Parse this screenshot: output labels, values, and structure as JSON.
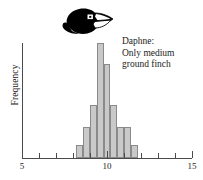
{
  "annotation": {
    "line1": "Daphne:",
    "line2": "Only medium",
    "line3": "ground finch"
  },
  "illustration": {
    "name": "medium-ground-finch-head",
    "color": "#000000",
    "eye_color": "#ffffff",
    "pupil_color": "#000000"
  },
  "chart_data": {
    "type": "bar",
    "title": "",
    "subtitle": "",
    "xlabel": "",
    "ylabel": "Frequency",
    "xlim": [
      5,
      15
    ],
    "ylim": [
      0,
      100
    ],
    "grid": false,
    "legend": null,
    "bar_fill": "#c9c9c9",
    "bar_stroke": "#8a8a8a",
    "axis_color": "#4a4a4a",
    "x_tick_labels": [
      "5",
      "10",
      "15"
    ],
    "x_tick_label_values": [
      5,
      10,
      15
    ],
    "x_minor_ticks": [
      5,
      6,
      7,
      8,
      9,
      10,
      11,
      12,
      13,
      14,
      15
    ],
    "y_tick_labels": [],
    "bin_width": 0.4,
    "bins": [
      {
        "x0": 8.2,
        "x1": 8.6,
        "value": 11
      },
      {
        "x0": 8.6,
        "x1": 9.0,
        "value": 27
      },
      {
        "x0": 9.0,
        "x1": 9.4,
        "value": 46
      },
      {
        "x0": 9.4,
        "x1": 9.8,
        "value": 100
      },
      {
        "x0": 9.8,
        "x1": 10.2,
        "value": 82
      },
      {
        "x0": 10.2,
        "x1": 10.6,
        "value": 46
      },
      {
        "x0": 10.6,
        "x1": 11.0,
        "value": 27
      },
      {
        "x0": 11.0,
        "x1": 11.4,
        "value": 27
      },
      {
        "x0": 11.4,
        "x1": 11.8,
        "value": 11
      }
    ],
    "categories": [
      "8.2-8.6",
      "8.6-9.0",
      "9.0-9.4",
      "9.4-9.8",
      "9.8-10.2",
      "10.2-10.6",
      "10.6-11.0",
      "11.0-11.4",
      "11.4-11.8"
    ],
    "values": [
      11,
      27,
      46,
      100,
      82,
      46,
      27,
      27,
      11
    ]
  }
}
